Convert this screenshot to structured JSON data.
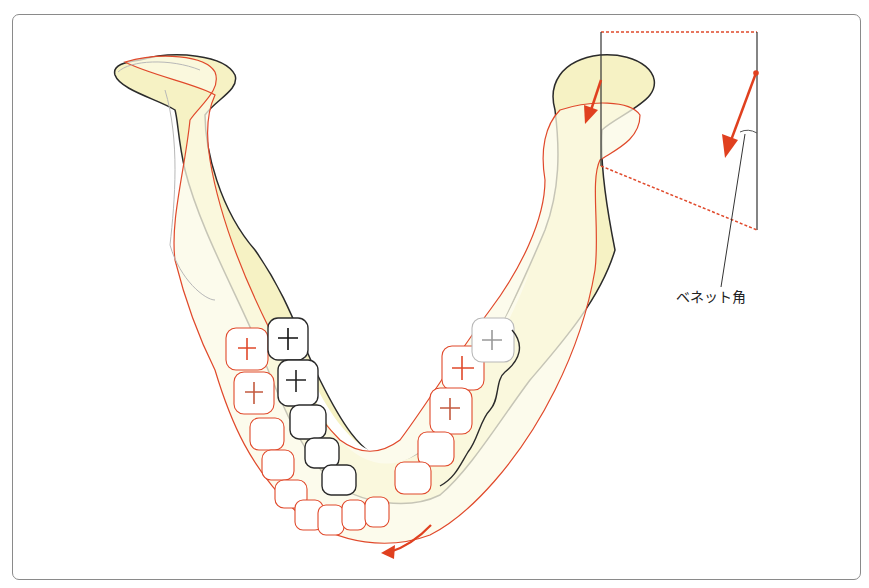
{
  "figure": {
    "annotation_label": "ベネット角",
    "colors": {
      "bone_fill": "#f6f2c4",
      "bone_fill_light": "#fbf9e6",
      "outline_original": "#2b2b2b",
      "outline_shifted": "#e0492b",
      "outline_gray": "#b8b8b8",
      "arrow": "#e0401f",
      "frame_border": "#8a8a8a"
    },
    "arrows": [
      {
        "name": "condyle-movement-arrow",
        "location": "right condyle"
      },
      {
        "name": "bennett-direction-arrow",
        "location": "inset diagram"
      },
      {
        "name": "mandible-rotation-arrow",
        "location": "below chin"
      }
    ]
  }
}
